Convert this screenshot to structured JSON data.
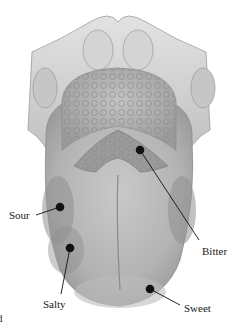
{
  "diagram": {
    "labels": [
      {
        "id": "sour",
        "text": "Sour"
      },
      {
        "id": "salty",
        "text": "Salty"
      },
      {
        "id": "bitter",
        "text": "Bitter"
      },
      {
        "id": "sweet",
        "text": "Sweet"
      }
    ],
    "edge_fragment": "d"
  }
}
